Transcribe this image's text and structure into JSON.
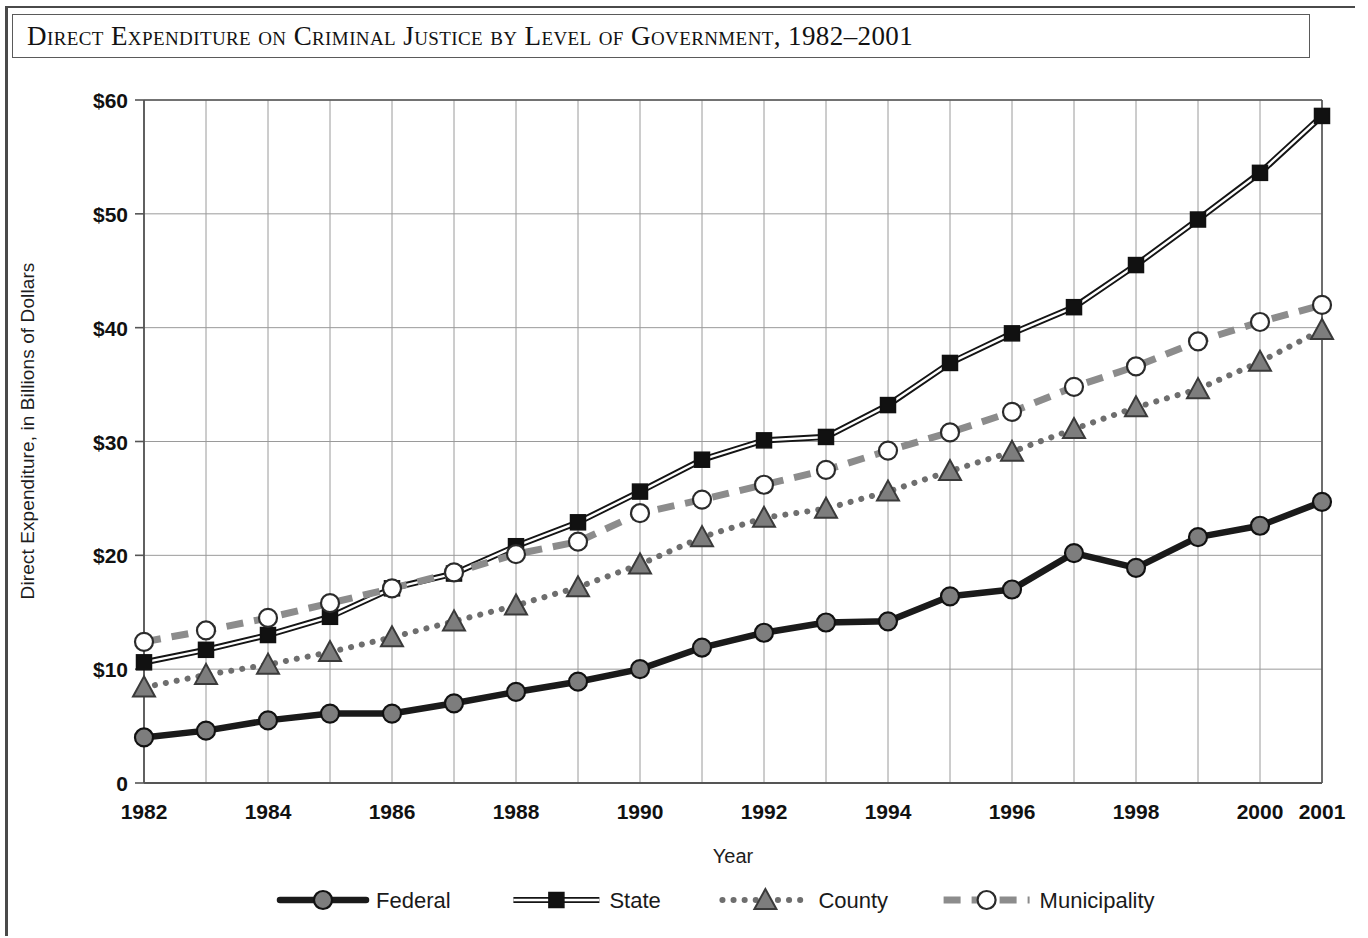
{
  "figure": {
    "title": "Direct Expenditure on Criminal Justice by Level of Government, 1982–2001"
  },
  "chart_data": {
    "type": "line",
    "title": "Direct Expenditure on Criminal Justice by Level of Government, 1982–2001",
    "xlabel": "Year",
    "ylabel": "Direct Expenditure, in Billions of Dollars",
    "xlim": [
      1982,
      2001
    ],
    "ylim": [
      0,
      60
    ],
    "ytick_labels": [
      "$60",
      "$50",
      "$40",
      "$30",
      "$20",
      "$10",
      "0"
    ],
    "ytick_values": [
      60,
      50,
      40,
      30,
      20,
      10,
      0
    ],
    "xtick_labels": [
      "1982",
      "1984",
      "1986",
      "1988",
      "1990",
      "1992",
      "1994",
      "1996",
      "1998",
      "2000",
      "2001"
    ],
    "xtick_values": [
      1982,
      1984,
      1986,
      1988,
      1990,
      1992,
      1994,
      1996,
      1998,
      2000,
      2001
    ],
    "grid": true,
    "legend_position": "bottom",
    "x": [
      1982,
      1983,
      1984,
      1985,
      1986,
      1987,
      1988,
      1989,
      1990,
      1991,
      1992,
      1993,
      1994,
      1995,
      1996,
      1997,
      1998,
      1999,
      2000,
      2001
    ],
    "series": [
      {
        "name": "Federal",
        "color": "#1a1a1a",
        "line_style": "solid-thick",
        "marker": "circle-filled",
        "values": [
          4.0,
          4.6,
          5.5,
          6.1,
          6.1,
          7.0,
          8.0,
          8.9,
          10.0,
          11.9,
          13.2,
          14.1,
          14.2,
          16.4,
          17.0,
          20.2,
          18.9,
          21.6,
          22.6,
          24.7
        ]
      },
      {
        "name": "State",
        "color": "#141414",
        "line_style": "double",
        "marker": "square-filled",
        "values": [
          10.6,
          11.7,
          13.0,
          14.6,
          17.1,
          18.4,
          20.8,
          22.9,
          25.6,
          28.4,
          30.1,
          30.4,
          33.2,
          36.9,
          39.5,
          41.8,
          45.5,
          49.5,
          53.6,
          58.6
        ]
      },
      {
        "name": "County",
        "color": "#6e6e6e",
        "line_style": "dotted",
        "marker": "triangle-filled",
        "values": [
          8.4,
          9.5,
          10.4,
          11.5,
          12.8,
          14.2,
          15.6,
          17.2,
          19.2,
          21.6,
          23.3,
          24.1,
          25.6,
          27.4,
          29.1,
          31.1,
          33.0,
          34.6,
          37.0,
          39.8
        ]
      },
      {
        "name": "Municipality",
        "color": "#8c8c8c",
        "line_style": "dashed",
        "marker": "circle-open",
        "values": [
          12.4,
          13.4,
          14.5,
          15.8,
          17.1,
          18.5,
          20.1,
          21.2,
          23.7,
          24.9,
          26.2,
          27.5,
          29.2,
          30.8,
          32.6,
          34.8,
          36.6,
          38.8,
          40.5,
          42.0
        ]
      }
    ]
  },
  "legend": {
    "items": [
      {
        "label": "Federal"
      },
      {
        "label": "State"
      },
      {
        "label": "County"
      },
      {
        "label": "Municipality"
      }
    ]
  }
}
